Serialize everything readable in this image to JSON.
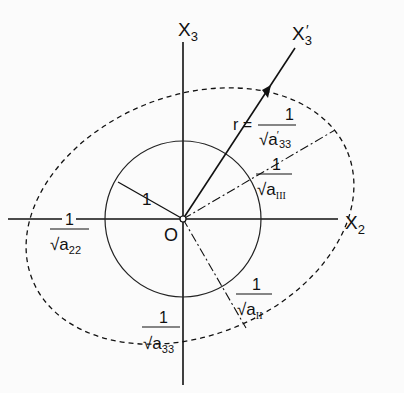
{
  "diagram": {
    "axes": {
      "x2_label": "X",
      "x2_sub": "2",
      "x3_label": "X",
      "x3_sub": "3",
      "x3prime_label": "X",
      "x3prime_sub": "3",
      "x3prime_mark": "′",
      "origin_label": "O"
    },
    "unit_circle": {
      "radius_label": "1"
    },
    "labels": {
      "r_prefix": "r =",
      "one": "1",
      "a33prime": "a′33",
      "a_III": "aIII",
      "a22": "a22",
      "a33": "a33",
      "a_II": "aII",
      "a_base": "a",
      "sub_33": "33",
      "sub_22": "22",
      "sub_III": "III",
      "sub_II": "II",
      "prime": "′"
    },
    "colors": {
      "ink": "#111111",
      "background": "#fbfbfb"
    }
  }
}
